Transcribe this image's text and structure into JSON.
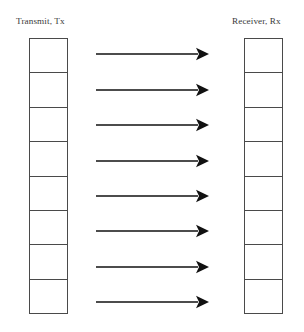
{
  "diagram": {
    "title_left": "Transmit, Tx",
    "title_right": "Receiver, Rx",
    "background_color": "#ffffff",
    "line_color": "#4a4a4a",
    "arrow_color": "#111111",
    "text_color": "#3a3a3a",
    "left_column": {
      "label": "Transmit, Tx",
      "cell_count": 8,
      "cells": [
        "",
        "",
        "",
        "",
        "",
        "",
        "",
        ""
      ]
    },
    "right_column": {
      "label": "Receiver, Rx",
      "cell_count": 8,
      "cells": [
        "",
        "",
        "",
        "",
        "",
        "",
        "",
        ""
      ]
    },
    "arrows": {
      "count": 8,
      "direction": "left-to-right",
      "items": [
        {
          "label": "",
          "y": 54
        },
        {
          "label": "",
          "y": 90
        },
        {
          "label": "",
          "y": 125
        },
        {
          "label": "",
          "y": 161
        },
        {
          "label": "",
          "y": 196
        },
        {
          "label": "",
          "y": 231
        },
        {
          "label": "",
          "y": 267
        },
        {
          "label": "",
          "y": 302
        }
      ],
      "x_start": 96,
      "x_end": 209
    }
  }
}
